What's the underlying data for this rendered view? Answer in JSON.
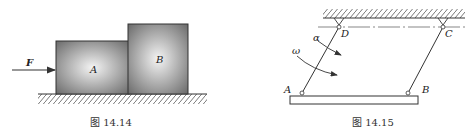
{
  "figures": [
    {
      "caption": "图 14.14",
      "labels": {
        "force": "F",
        "block_a": "A",
        "block_b": "B"
      }
    },
    {
      "caption": "图 14.15",
      "labels": {
        "alpha": "α",
        "omega": "ω",
        "a": "A",
        "b": "B",
        "c": "C",
        "d": "D"
      }
    }
  ]
}
